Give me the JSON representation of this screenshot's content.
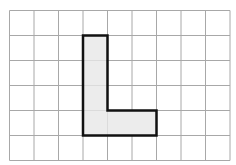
{
  "diagram": {
    "type": "grid-shape",
    "grid": {
      "columns": 9,
      "rows": 6,
      "left": 9.5,
      "top": 10.5,
      "cell_width": 24.5,
      "cell_height": 25,
      "line_color": "#a8a8a8"
    },
    "shape": {
      "name": "L-shape",
      "cells": [
        [
          3,
          1
        ],
        [
          3,
          2
        ],
        [
          3,
          3
        ],
        [
          3,
          4
        ],
        [
          4,
          4
        ],
        [
          5,
          4
        ]
      ],
      "fill_color": "#ececec",
      "outline_color": "#111111",
      "outline_width": 2.5
    }
  }
}
